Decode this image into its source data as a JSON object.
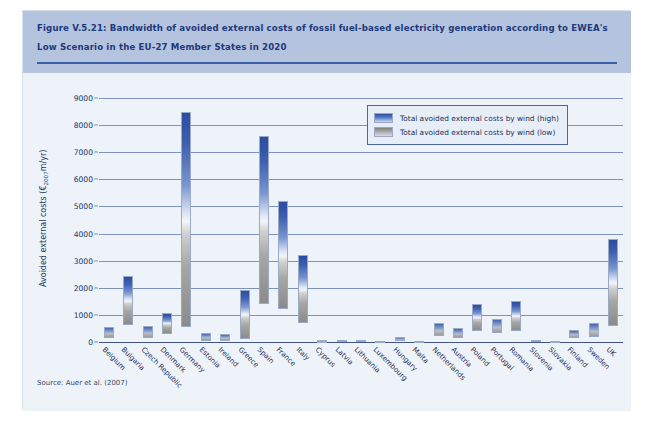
{
  "figure": {
    "title": "Figure V.5.21: Bandwidth of avoided external costs of fossil fuel-based electricity generation according to EWEA's Low Scenario in the EU-27 Member States in 2020",
    "source": "Source: Auer et al. (2007)",
    "title_band_color": "#b4c3de",
    "plot_bg_color": "#eef2f9",
    "gridline_color": "#7d93bd",
    "high_color": "#2b4da0",
    "low_color": "#7f7f7f"
  },
  "legend": {
    "position": "top-right",
    "entries": [
      {
        "label": "Total avoided external costs by wind (high)",
        "swatch": "high"
      },
      {
        "label": "Total avoided external costs by wind (low)",
        "swatch": "low"
      }
    ]
  },
  "axes": {
    "y_title": "Avoided external costs (€2007m/yr)",
    "y_title_prefix": "Avoided external costs (€",
    "y_title_sub": "2007",
    "y_title_suffix": "m/yr)",
    "y_ticks": [
      0,
      1000,
      2000,
      3000,
      4000,
      5000,
      6000,
      7000,
      8000,
      9000
    ],
    "y_min": 0,
    "y_max": 9000
  },
  "chart_data": {
    "type": "bar",
    "title": "Bandwidth of avoided external costs of fossil fuel-based electricity generation according to EWEA's Low Scenario in the EU-27 Member States in 2020",
    "xlabel": "",
    "ylabel": "Avoided external costs (€2007m/yr)",
    "ylim": [
      0,
      9000
    ],
    "grid": true,
    "legend_position": "top-right",
    "note": "Each bar is a floating range: bottom = low estimate, top = high estimate; fill is a gradient from grey (low) at the bottom to blue (high) at the top.",
    "categories": [
      "Belgium",
      "Bulgaria",
      "Czech Republic",
      "Denmark",
      "Germany",
      "Estonia",
      "Ireland",
      "Greece",
      "Spain",
      "France",
      "Italy",
      "Cyprus",
      "Latvia",
      "Lithuania",
      "Luxembourg",
      "Hungary",
      "Malta",
      "Netherlands",
      "Austria",
      "Poland",
      "Portugal",
      "Romania",
      "Slovenia",
      "Slovakia",
      "Finland",
      "Sweden",
      "UK"
    ],
    "series": [
      {
        "name": "Total avoided external costs by wind (low)",
        "values": [
          130,
          620,
          150,
          300,
          550,
          40,
          45,
          120,
          1400,
          1200,
          700,
          20,
          20,
          20,
          15,
          50,
          10,
          210,
          130,
          420,
          350,
          420,
          25,
          15,
          150,
          180,
          600
        ]
      },
      {
        "name": "Total avoided external costs by wind (high)",
        "values": [
          560,
          2450,
          600,
          1060,
          8500,
          330,
          310,
          1900,
          7600,
          5200,
          3200,
          60,
          90,
          80,
          40,
          170,
          30,
          700,
          500,
          1400,
          850,
          1500,
          90,
          50,
          450,
          700,
          3800
        ]
      }
    ]
  }
}
